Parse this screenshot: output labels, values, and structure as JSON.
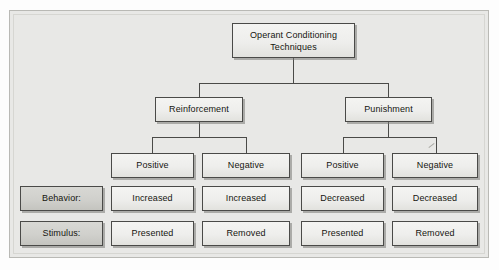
{
  "diagram": {
    "title": "Operant Conditioning Techniques",
    "root": {
      "label": "Operant Conditioning Techniques"
    },
    "branches": [
      {
        "label": "Reinforcement"
      },
      {
        "label": "Punishment"
      }
    ],
    "row_labels": [
      {
        "label": "Behavior:"
      },
      {
        "label": "Stimulus:"
      }
    ],
    "columns": [
      {
        "valence": "Positive",
        "behavior": "Increased",
        "stimulus": "Presented"
      },
      {
        "valence": "Negative",
        "behavior": "Increased",
        "stimulus": "Removed"
      },
      {
        "valence": "Positive",
        "behavior": "Decreased",
        "stimulus": "Presented"
      },
      {
        "valence": "Negative",
        "behavior": "Decreased",
        "stimulus": "Removed"
      }
    ],
    "colors": {
      "canvas": "#e8e8e6",
      "box_fill": "#eeeeec",
      "label_box_fill": "#d0d0cc",
      "border": "#4a4a48",
      "text": "#15150f"
    }
  }
}
